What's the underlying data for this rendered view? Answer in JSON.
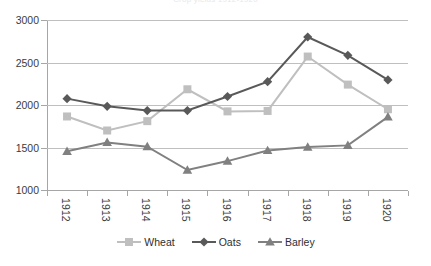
{
  "chart_data": {
    "type": "line",
    "title": "Crop yields 1912-1920",
    "xlabel": "",
    "ylabel": "",
    "categories": [
      "1912",
      "1913",
      "1914",
      "1915",
      "1916",
      "1917",
      "1918",
      "1919",
      "1920"
    ],
    "ylim": [
      1000,
      3000
    ],
    "ytick_labels": [
      "3000",
      "2500",
      "2000",
      "1500",
      "1000"
    ],
    "ytick_values": [
      3000,
      2500,
      2000,
      1500,
      1000
    ],
    "grid": true,
    "legend_position": "bottom-center",
    "series": [
      {
        "name": "Wheat",
        "color": "#bfbfbf",
        "marker": "square",
        "values": [
          1865,
          1700,
          1810,
          2185,
          1925,
          1930,
          2570,
          2240,
          1950
        ]
      },
      {
        "name": "Oats",
        "color": "#595959",
        "marker": "diamond",
        "values": [
          2075,
          1985,
          1935,
          1935,
          2100,
          2275,
          2800,
          2585,
          2295
        ]
      },
      {
        "name": "Barley",
        "color": "#808080",
        "marker": "triangle",
        "values": [
          1455,
          1560,
          1510,
          1235,
          1340,
          1465,
          1505,
          1525,
          1860
        ]
      }
    ]
  },
  "colors": {
    "background": "#ffffff",
    "gridline": "#bfbfbf",
    "axis": "#a6a6a6",
    "tick_text": "#3b3b3b",
    "legend_text": "#2f2f2f",
    "wheat": "#bfbfbf",
    "oats": "#595959",
    "barley": "#808080"
  }
}
